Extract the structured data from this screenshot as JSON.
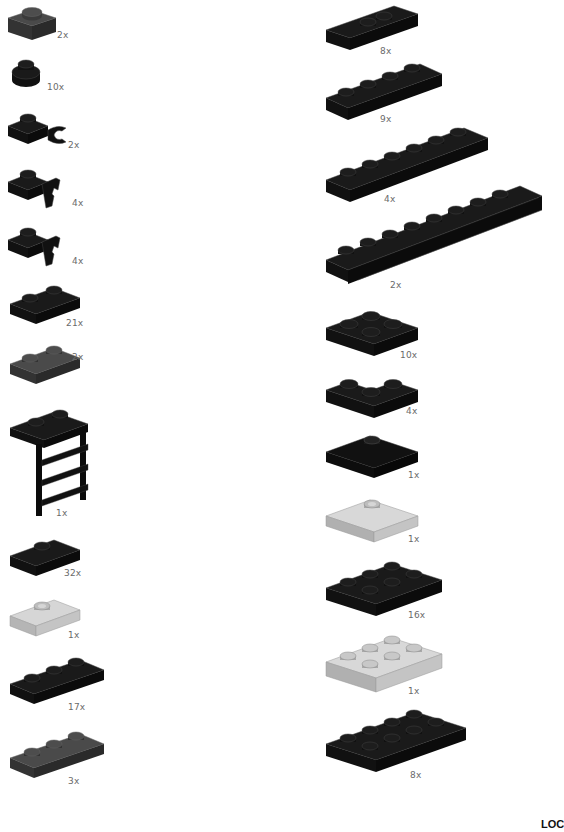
{
  "page": {
    "footer_code": "LOC"
  },
  "colors": {
    "black": "#0b0b0b",
    "dark_gray": "#3c3c3c",
    "light_gray": "#c9c9c9",
    "quantity_text": "#6a6a6a"
  },
  "left_column": [
    {
      "part": "plate-1x1",
      "color": "dark gray",
      "quantity": "2x"
    },
    {
      "part": "plate-round-1x1",
      "color": "black",
      "quantity": "10x"
    },
    {
      "part": "plate-1x1-horizontal-clip",
      "color": "black",
      "quantity": "2x"
    },
    {
      "part": "plate-1x1-vertical-clip",
      "color": "black",
      "quantity": "4x"
    },
    {
      "part": "plate-1x1-vertical-clip",
      "color": "black",
      "quantity": "4x"
    },
    {
      "part": "plate-1x2",
      "color": "black",
      "quantity": "21x"
    },
    {
      "part": "plate-1x2",
      "color": "dark gray",
      "quantity": "2x"
    },
    {
      "part": "plate-1x2-ladder",
      "color": "black",
      "quantity": "1x"
    },
    {
      "part": "plate-1x2-jumper",
      "color": "black",
      "quantity": "32x"
    },
    {
      "part": "plate-1x2-jumper",
      "color": "light gray",
      "quantity": "1x"
    },
    {
      "part": "plate-1x3",
      "color": "black",
      "quantity": "17x"
    },
    {
      "part": "plate-1x3",
      "color": "dark gray",
      "quantity": "3x"
    }
  ],
  "right_column": [
    {
      "part": "plate-1x2-offset",
      "color": "black",
      "quantity": "8x"
    },
    {
      "part": "plate-1x4",
      "color": "black",
      "quantity": "9x"
    },
    {
      "part": "plate-1x6",
      "color": "black",
      "quantity": "4x"
    },
    {
      "part": "plate-1x8-door-rail",
      "color": "black",
      "quantity": "2x"
    },
    {
      "part": "plate-2x2",
      "color": "black",
      "quantity": "10x"
    },
    {
      "part": "plate-2x2-corner",
      "color": "black",
      "quantity": "4x"
    },
    {
      "part": "plate-2x2-jumper",
      "color": "black",
      "quantity": "1x"
    },
    {
      "part": "plate-2x2-jumper",
      "color": "light gray",
      "quantity": "1x"
    },
    {
      "part": "plate-2x3",
      "color": "black",
      "quantity": "16x"
    },
    {
      "part": "plate-2x3",
      "color": "light gray",
      "quantity": "1x"
    },
    {
      "part": "plate-2x4",
      "color": "black",
      "quantity": "8x"
    }
  ]
}
